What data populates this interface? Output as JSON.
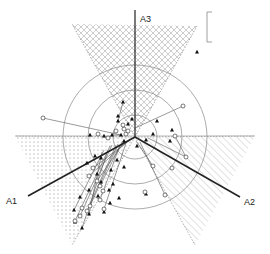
{
  "diagram": {
    "center": [
      135,
      137
    ],
    "circle_radii": [
      22,
      47,
      72
    ],
    "axes": [
      {
        "id": "A1",
        "label": "A1",
        "end": [
          28,
          196
        ],
        "label_pos": [
          6,
          204
        ]
      },
      {
        "id": "A2",
        "label": "A2",
        "end": [
          240,
          197
        ],
        "label_pos": [
          244,
          205
        ]
      },
      {
        "id": "A3",
        "label": "A3",
        "end": [
          135,
          10
        ],
        "label_pos": [
          140,
          22
        ]
      }
    ],
    "sectors": [
      {
        "name": "crosshatch-sector",
        "pattern": "crosshatch",
        "apex": [
          135,
          137
        ],
        "p1": [
          72,
          24
        ],
        "p2": [
          197,
          26
        ]
      },
      {
        "name": "dotted-sector",
        "pattern": "dots",
        "apex": [
          135,
          137
        ],
        "p1": [
          15,
          136
        ],
        "p2": [
          72,
          245
        ]
      },
      {
        "name": "diagonal-sector",
        "pattern": "diagonal",
        "apex": [
          135,
          137
        ],
        "p1": [
          255,
          136
        ],
        "p2": [
          195,
          245
        ]
      }
    ],
    "scale_bar": {
      "x": 207,
      "y1": 12,
      "y2": 42
    },
    "points_filled": [
      [
        123,
        102
      ],
      [
        118,
        116
      ],
      [
        118,
        121
      ],
      [
        132,
        119
      ],
      [
        128,
        124
      ],
      [
        157,
        121
      ],
      [
        172,
        130
      ],
      [
        170,
        141
      ],
      [
        112,
        135
      ],
      [
        104,
        136
      ],
      [
        90,
        135
      ],
      [
        121,
        135
      ],
      [
        124,
        141
      ],
      [
        95,
        156
      ],
      [
        87,
        163
      ],
      [
        101,
        158
      ],
      [
        101,
        182
      ],
      [
        97,
        174
      ],
      [
        117,
        160
      ],
      [
        109,
        190
      ],
      [
        113,
        184
      ],
      [
        119,
        198
      ],
      [
        89,
        214
      ],
      [
        74,
        210
      ],
      [
        75,
        222
      ],
      [
        82,
        228
      ],
      [
        104,
        212
      ],
      [
        110,
        203
      ],
      [
        146,
        140
      ],
      [
        153,
        134
      ],
      [
        197,
        52
      ],
      [
        146,
        194
      ],
      [
        137,
        146
      ],
      [
        124,
        167
      ],
      [
        111,
        170
      ],
      [
        89,
        190
      ],
      [
        80,
        197
      ],
      [
        98,
        196
      ]
    ],
    "points_open": [
      [
        183,
        106
      ],
      [
        175,
        136
      ],
      [
        186,
        157
      ],
      [
        172,
        168
      ],
      [
        116,
        131
      ],
      [
        108,
        138
      ],
      [
        98,
        134
      ],
      [
        126,
        134
      ],
      [
        124,
        129
      ],
      [
        93,
        168
      ],
      [
        89,
        176
      ],
      [
        97,
        181
      ],
      [
        100,
        186
      ],
      [
        103,
        191
      ],
      [
        90,
        206
      ],
      [
        100,
        200
      ],
      [
        87,
        211
      ],
      [
        80,
        216
      ],
      [
        82,
        208
      ],
      [
        75,
        221
      ],
      [
        104,
        209
      ],
      [
        153,
        166
      ],
      [
        165,
        195
      ],
      [
        145,
        192
      ],
      [
        43,
        118
      ],
      [
        128,
        131
      ],
      [
        123,
        125
      ]
    ],
    "connectors": [
      [
        [
          43,
          118
        ],
        [
          121,
          135
        ]
      ],
      [
        [
          183,
          106
        ],
        [
          135,
          128
        ]
      ],
      [
        [
          175,
          136
        ],
        [
          186,
          157
        ]
      ],
      [
        [
          186,
          157
        ],
        [
          148,
          138
        ]
      ],
      [
        [
          123,
          102
        ],
        [
          118,
          121
        ]
      ],
      [
        [
          112,
          135
        ],
        [
          120,
          135
        ]
      ],
      [
        [
          165,
          195
        ],
        [
          140,
          142
        ]
      ],
      [
        [
          146,
          194
        ],
        [
          145,
          192
        ]
      ],
      [
        [
          153,
          166
        ],
        [
          136,
          141
        ]
      ],
      [
        [
          93,
          168
        ],
        [
          130,
          140
        ]
      ],
      [
        [
          89,
          176
        ],
        [
          128,
          141
        ]
      ],
      [
        [
          97,
          181
        ],
        [
          124,
          142
        ]
      ],
      [
        [
          100,
          186
        ],
        [
          122,
          142
        ]
      ],
      [
        [
          90,
          206
        ],
        [
          118,
          144
        ]
      ],
      [
        [
          87,
          211
        ],
        [
          116,
          145
        ]
      ],
      [
        [
          80,
          216
        ],
        [
          112,
          145
        ]
      ],
      [
        [
          75,
          221
        ],
        [
          110,
          146
        ]
      ],
      [
        [
          104,
          209
        ],
        [
          126,
          143
        ]
      ],
      [
        [
          100,
          200
        ],
        [
          120,
          145
        ]
      ],
      [
        [
          82,
          228
        ],
        [
          108,
          150
        ]
      ],
      [
        [
          74,
          210
        ],
        [
          104,
          150
        ]
      ],
      [
        [
          89,
          214
        ],
        [
          102,
          152
        ]
      ]
    ]
  }
}
